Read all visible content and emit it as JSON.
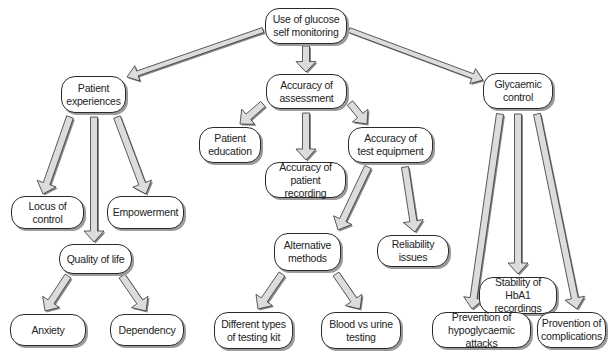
{
  "diagram": {
    "type": "concept-map",
    "colors": {
      "arrow_fill": "#dcdcdc",
      "arrow_stroke": "#333333",
      "arrow_shadow": "#888888",
      "node_border": "#2a2a2a",
      "node_shadow": "#9a9a9a"
    },
    "nodes": {
      "root": {
        "label": "Use of glucose\nself monitoring",
        "x": 265,
        "y": 8,
        "w": 82,
        "h": 36
      },
      "patient_experiences": {
        "label": "Patient\nexperiences",
        "x": 61,
        "y": 76,
        "w": 65,
        "h": 37
      },
      "accuracy_assessment": {
        "label": "Accuracy of\nassessment",
        "x": 266,
        "y": 74,
        "w": 81,
        "h": 35
      },
      "glycaemic_control": {
        "label": "Glycaemic\ncontrol",
        "x": 483,
        "y": 73,
        "w": 70,
        "h": 36
      },
      "patient_education": {
        "label": "Patient\neducation",
        "x": 199,
        "y": 127,
        "w": 62,
        "h": 36
      },
      "accuracy_patient_recording": {
        "label": "Accuracy of\npatient recording",
        "x": 265,
        "y": 162,
        "w": 81,
        "h": 36
      },
      "accuracy_test_equipment": {
        "label": "Accuracy of\ntest equipment",
        "x": 348,
        "y": 127,
        "w": 85,
        "h": 36
      },
      "locus_of_control": {
        "label": "Locus of control",
        "x": 11,
        "y": 196,
        "w": 73,
        "h": 33
      },
      "empowerment": {
        "label": "Empowerment",
        "x": 107,
        "y": 196,
        "w": 77,
        "h": 33
      },
      "quality_of_life": {
        "label": "Quality of life",
        "x": 59,
        "y": 244,
        "w": 73,
        "h": 30
      },
      "alternative_methods": {
        "label": "Alternative\nmethods",
        "x": 274,
        "y": 233,
        "w": 67,
        "h": 38
      },
      "reliability_issues": {
        "label": "Reliability issues",
        "x": 377,
        "y": 235,
        "w": 72,
        "h": 32
      },
      "anxiety": {
        "label": "Anxiety",
        "x": 10,
        "y": 314,
        "w": 76,
        "h": 32
      },
      "dependency": {
        "label": "Dependency",
        "x": 110,
        "y": 314,
        "w": 74,
        "h": 32
      },
      "different_testing_kit": {
        "label": "Different types\nof testing kit",
        "x": 214,
        "y": 312,
        "w": 79,
        "h": 37
      },
      "blood_vs_urine": {
        "label": "Blood vs urine\ntesting",
        "x": 321,
        "y": 312,
        "w": 80,
        "h": 37
      },
      "stability_hba1": {
        "label": "Stability of HbA1\nrecordings",
        "x": 479,
        "y": 277,
        "w": 78,
        "h": 37
      },
      "prevention_hypo": {
        "label": "Prevention of\nhypoglycaemic attacks",
        "x": 432,
        "y": 312,
        "w": 99,
        "h": 36
      },
      "prevention_complications": {
        "label": "Provention of\ncomplications",
        "x": 537,
        "y": 312,
        "w": 69,
        "h": 36
      }
    },
    "edges": [
      {
        "from": "root",
        "to": "patient_experiences",
        "x1": 263,
        "y1": 30,
        "x2": 127,
        "y2": 77,
        "w": 5
      },
      {
        "from": "root",
        "to": "accuracy_assessment",
        "x1": 306,
        "y1": 46,
        "x2": 306,
        "y2": 72,
        "w": 7
      },
      {
        "from": "root",
        "to": "glycaemic_control",
        "x1": 349,
        "y1": 30,
        "x2": 483,
        "y2": 80,
        "w": 5
      },
      {
        "from": "patient_experiences",
        "to": "locus_of_control",
        "x1": 70,
        "y1": 117,
        "x2": 43,
        "y2": 194,
        "w": 7
      },
      {
        "from": "patient_experiences",
        "to": "quality_of_life",
        "x1": 94,
        "y1": 117,
        "x2": 94,
        "y2": 242,
        "w": 7
      },
      {
        "from": "patient_experiences",
        "to": "empowerment",
        "x1": 117,
        "y1": 117,
        "x2": 146,
        "y2": 194,
        "w": 7
      },
      {
        "from": "quality_of_life",
        "to": "anxiety",
        "x1": 68,
        "y1": 276,
        "x2": 45,
        "y2": 311,
        "w": 7
      },
      {
        "from": "quality_of_life",
        "to": "dependency",
        "x1": 122,
        "y1": 276,
        "x2": 146,
        "y2": 311,
        "w": 7
      },
      {
        "from": "accuracy_assessment",
        "to": "patient_education",
        "x1": 263,
        "y1": 104,
        "x2": 240,
        "y2": 124,
        "w": 7
      },
      {
        "from": "accuracy_assessment",
        "to": "accuracy_patient_recording",
        "x1": 306,
        "y1": 113,
        "x2": 306,
        "y2": 160,
        "w": 7
      },
      {
        "from": "accuracy_assessment",
        "to": "accuracy_test_equipment",
        "x1": 350,
        "y1": 103,
        "x2": 367,
        "y2": 124,
        "w": 7
      },
      {
        "from": "accuracy_test_equipment",
        "to": "alternative_methods",
        "x1": 368,
        "y1": 167,
        "x2": 338,
        "y2": 230,
        "w": 7
      },
      {
        "from": "accuracy_test_equipment",
        "to": "reliability_issues",
        "x1": 405,
        "y1": 167,
        "x2": 415,
        "y2": 232,
        "w": 7
      },
      {
        "from": "alternative_methods",
        "to": "different_testing_kit",
        "x1": 282,
        "y1": 274,
        "x2": 258,
        "y2": 309,
        "w": 7
      },
      {
        "from": "alternative_methods",
        "to": "blood_vs_urine",
        "x1": 336,
        "y1": 274,
        "x2": 360,
        "y2": 309,
        "w": 7
      },
      {
        "from": "glycaemic_control",
        "to": "prevention_hypo",
        "x1": 500,
        "y1": 114,
        "x2": 472,
        "y2": 309,
        "w": 7
      },
      {
        "from": "glycaemic_control",
        "to": "stability_hba1",
        "x1": 518,
        "y1": 114,
        "x2": 518,
        "y2": 274,
        "w": 7
      },
      {
        "from": "glycaemic_control",
        "to": "prevention_complications",
        "x1": 537,
        "y1": 114,
        "x2": 577,
        "y2": 309,
        "w": 7
      }
    ]
  }
}
